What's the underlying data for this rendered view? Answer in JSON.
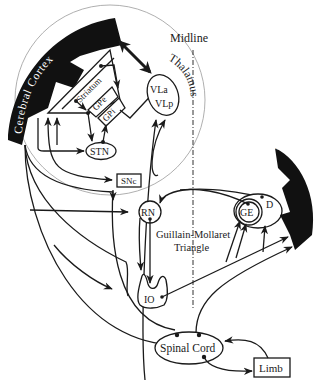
{
  "diagram": {
    "labels": {
      "midline": "Midline",
      "cerebral_cortex": "Cerebral Cortex",
      "cerebellum": "Cerebellum",
      "thalamus": "Thalamus",
      "vla": "VLa",
      "vlp": "VLp",
      "striatum": "Striatum",
      "gpe": "GPe",
      "gpi": "GPi",
      "stn": "STN",
      "snc": "SNc",
      "rn": "RN",
      "ge": "GE",
      "d": "D",
      "io": "IO",
      "gm_line1": "Guillain-Mollaret",
      "gm_line2": "Triangle",
      "spinal_cord": "Spinal Cord",
      "limb": "Limb"
    },
    "colors": {
      "ink": "#1a1a1a",
      "fill_dark": "#111111",
      "guide_circle": "#9a9a9a",
      "background": "#ffffff"
    }
  }
}
